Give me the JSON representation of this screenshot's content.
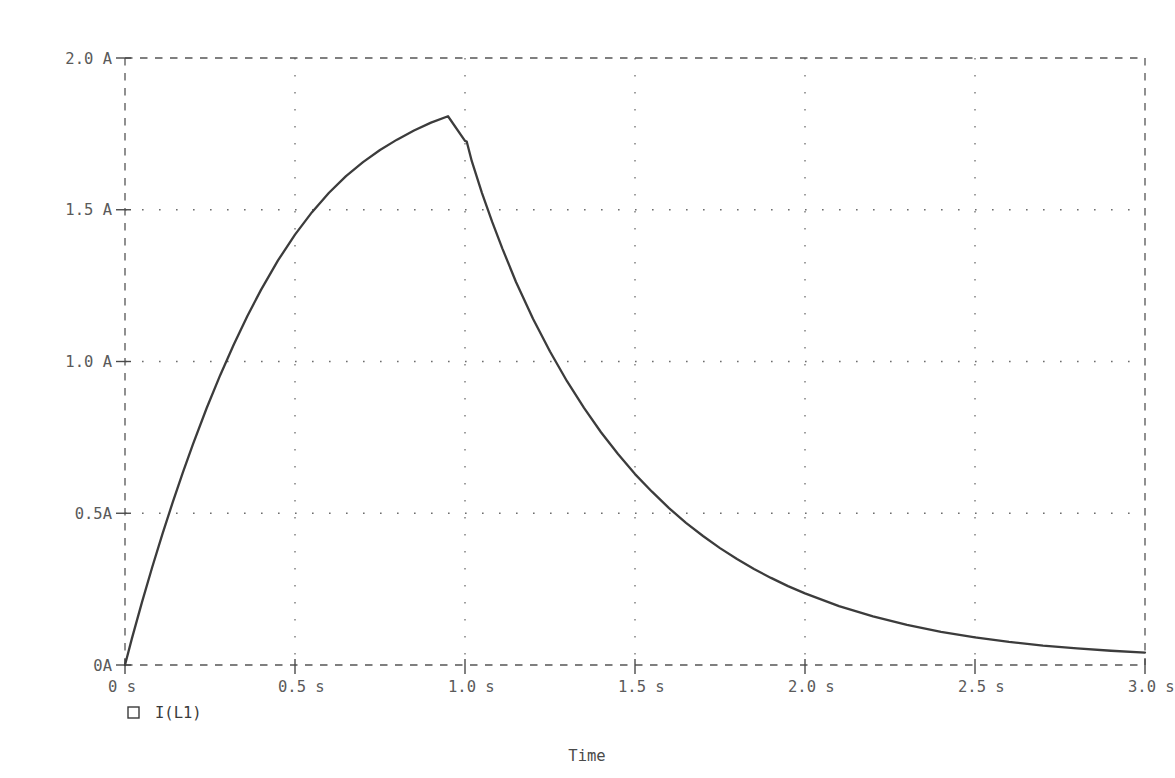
{
  "chart_data": {
    "type": "line",
    "title": "",
    "xlabel": "Time",
    "ylabel": "",
    "xlim": [
      0,
      3.0
    ],
    "ylim": [
      0,
      2.0
    ],
    "grid": true,
    "grid_style": "dotted",
    "frame_style": "dashed",
    "legend_position": "below-left",
    "x_tick_labels": [
      "0 s",
      "0.5 s",
      "1.0 s",
      "1.5 s",
      "2.0 s",
      "2.5 s",
      "3.0 s"
    ],
    "x_tick_values": [
      0,
      0.5,
      1.0,
      1.5,
      2.0,
      2.5,
      3.0
    ],
    "y_tick_labels": [
      "0A",
      "0.5A",
      "1.0 A",
      "1.5 A",
      "2.0 A"
    ],
    "y_tick_values": [
      0,
      0.5,
      1.0,
      1.5,
      2.0
    ],
    "series": [
      {
        "name": "I(L1)",
        "color": "#3c3c3c",
        "marker": "square-outline",
        "x": [
          0,
          0.02,
          0.05,
          0.08,
          0.11,
          0.14,
          0.17,
          0.2,
          0.24,
          0.28,
          0.32,
          0.36,
          0.4,
          0.45,
          0.5,
          0.55,
          0.6,
          0.65,
          0.7,
          0.75,
          0.8,
          0.85,
          0.9,
          0.95,
          1.0,
          1.005,
          1.02,
          1.05,
          1.08,
          1.11,
          1.15,
          1.2,
          1.25,
          1.3,
          1.35,
          1.4,
          1.45,
          1.5,
          1.55,
          1.6,
          1.65,
          1.7,
          1.75,
          1.8,
          1.85,
          1.9,
          1.95,
          2.0,
          2.1,
          2.2,
          2.3,
          2.4,
          2.5,
          2.6,
          2.7,
          2.8,
          2.9,
          3.0
        ],
        "y": [
          0,
          0.086,
          0.207,
          0.322,
          0.431,
          0.535,
          0.634,
          0.728,
          0.846,
          0.955,
          1.056,
          1.15,
          1.236,
          1.333,
          1.418,
          1.492,
          1.556,
          1.611,
          1.657,
          1.697,
          1.731,
          1.761,
          1.787,
          1.808,
          1.727,
          1.725,
          1.66,
          1.555,
          1.46,
          1.372,
          1.262,
          1.141,
          1.033,
          0.935,
          0.847,
          0.767,
          0.695,
          0.629,
          0.571,
          0.517,
          0.468,
          0.425,
          0.385,
          0.349,
          0.316,
          0.287,
          0.26,
          0.236,
          0.194,
          0.16,
          0.132,
          0.109,
          0.091,
          0.076,
          0.064,
          0.055,
          0.047,
          0.041
        ],
        "peak": {
          "x": 1.0,
          "y": 1.73
        }
      }
    ],
    "annotations": []
  },
  "legend": {
    "entries": [
      {
        "marker": "square-marker",
        "label": "I(L1)"
      }
    ]
  },
  "axis": {
    "x_title": "Time"
  },
  "colors": {
    "trace": "#3c3c3c",
    "grid": "#6d6d6d",
    "frame": "#555555",
    "text": "#5a5a5a",
    "background": "#ffffff"
  }
}
